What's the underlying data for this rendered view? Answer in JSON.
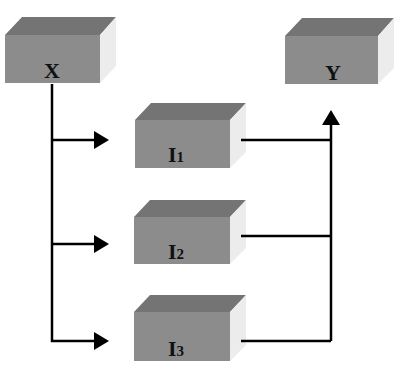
{
  "diagram": {
    "type": "flow",
    "colors": {
      "front": "#8c8c8c",
      "top": "#747474",
      "side": "#ececec",
      "line": "#000000"
    },
    "nodes": [
      {
        "id": "X",
        "label": "X",
        "sub": ""
      },
      {
        "id": "Y",
        "label": "Y",
        "sub": ""
      },
      {
        "id": "I1",
        "label": "I",
        "sub": "1"
      },
      {
        "id": "I2",
        "label": "I",
        "sub": "2"
      },
      {
        "id": "I3",
        "label": "I",
        "sub": "3"
      }
    ],
    "edges": [
      {
        "from": "X",
        "to": "I1"
      },
      {
        "from": "X",
        "to": "I2"
      },
      {
        "from": "X",
        "to": "I3"
      },
      {
        "from": "I1",
        "to": "Y"
      },
      {
        "from": "I2",
        "to": "Y"
      },
      {
        "from": "I3",
        "to": "Y"
      }
    ]
  }
}
